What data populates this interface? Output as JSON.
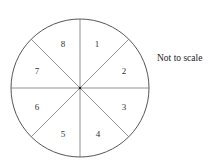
{
  "diagram": {
    "type": "spinner",
    "sectors": [
      {
        "label": "1"
      },
      {
        "label": "2"
      },
      {
        "label": "3"
      },
      {
        "label": "4"
      },
      {
        "label": "5"
      },
      {
        "label": "6"
      },
      {
        "label": "7"
      },
      {
        "label": "8"
      }
    ],
    "note": "Not to scale",
    "colors": {
      "line": "#555555",
      "background": "#ffffff"
    }
  }
}
